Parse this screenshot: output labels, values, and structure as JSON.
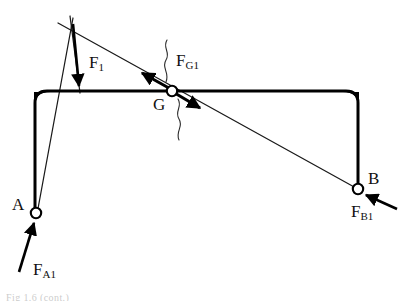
{
  "figure": {
    "background_color": "#ffffff",
    "stroke_color": "#000000",
    "canvas": {
      "width": 402,
      "height": 302
    }
  },
  "labels": {
    "point_a": "A",
    "point_b": "B",
    "point_g": "G",
    "force_f1_base": "F",
    "force_f1_sub": "1",
    "force_fg1_base": "F",
    "force_fg1_sub": "G1",
    "force_fa1_base": "F",
    "force_fa1_sub": "A1",
    "force_fb1_base": "F",
    "force_fb1_sub": "B1"
  },
  "caption": {
    "clipped_text": "Fig 1.6 (cont.)"
  },
  "geometry": {
    "frame": {
      "name": "rigid-frame",
      "top_beam": {
        "x1": 33,
        "y1": 91,
        "x2": 358,
        "y2": 91
      },
      "left_leg": {
        "x1": 35,
        "y1": 91,
        "x2": 36,
        "y2": 210
      },
      "right_leg": {
        "x1": 358,
        "y1": 91,
        "x2": 358,
        "y2": 187
      },
      "corner_radius": 12,
      "line_width": 3
    },
    "pins": [
      {
        "name": "pin-a",
        "label": "A",
        "cx": 36,
        "cy": 213,
        "r": 5.2
      },
      {
        "name": "pin-g",
        "label": "G",
        "cx": 172,
        "cy": 91,
        "r": 5.2
      },
      {
        "name": "pin-b",
        "label": "B",
        "cx": 358,
        "cy": 189,
        "r": 5.2
      }
    ],
    "action_line": {
      "name": "three-force-action-line",
      "x1": 58,
      "y1": 23,
      "x2": 356,
      "y2": 188
    },
    "reaction_line_a": {
      "name": "reaction-line-through-a",
      "x1": 73,
      "y1": 18,
      "x2": 37,
      "y2": 214
    },
    "load_line_f1": {
      "name": "applied-load-line-of-action",
      "x1": 70,
      "y1": 16,
      "x2": 80,
      "y2": 92
    }
  },
  "force_vectors": [
    {
      "name": "force-f1",
      "label": "F1",
      "x1": 73,
      "y1": 24,
      "x2": 79,
      "y2": 88,
      "direction": "down",
      "head_size": 9,
      "line_width": 2.6
    },
    {
      "name": "force-fg1-up-left",
      "label": "FG1",
      "x1": 178,
      "y1": 93,
      "x2": 139,
      "y2": 71,
      "direction": "up-left",
      "head_size": 9,
      "line_width": 3
    },
    {
      "name": "force-fg1-down-right",
      "label": "FG1",
      "x1": 166,
      "y1": 88,
      "x2": 203,
      "y2": 110,
      "direction": "down-right",
      "head_size": 9,
      "line_width": 3
    },
    {
      "name": "force-fa1",
      "label": "FA1",
      "x1": 19,
      "y1": 272,
      "x2": 34,
      "y2": 221,
      "direction": "up-right",
      "head_size": 9,
      "line_width": 2.6
    },
    {
      "name": "force-fb1",
      "label": "FB1",
      "x1": 397,
      "y1": 209,
      "x2": 364,
      "y2": 194,
      "direction": "up-left",
      "head_size": 9,
      "line_width": 2.6
    }
  ],
  "squiggles": [
    {
      "name": "squiggle-above-g",
      "path": "M 167 40 C 162 48, 171 52, 166 60 C 161 68, 170 72, 166 82"
    },
    {
      "name": "squiggle-below-g",
      "path": "M 178 99 C 183 107, 174 111, 179 119 C 184 127, 175 131, 179 140"
    }
  ]
}
